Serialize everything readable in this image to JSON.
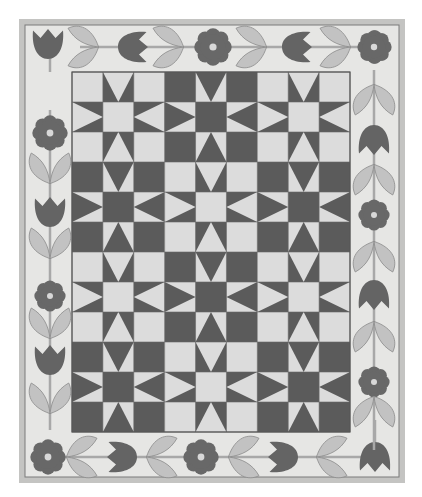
{
  "image": {
    "subject": "Sawtooth star quilt with flower and tulip applique border",
    "mode": "grayscale"
  },
  "colors": {
    "dark": "#5b5b5b",
    "light": "#dcdcdc",
    "border_bg": "#e6e6e4",
    "frame": "#c4c4c2",
    "frame_line": "#7a7a7a",
    "flower": "#686868",
    "tulip": "#646464",
    "leaf": "#c2c2c2",
    "leaf_edge": "#8a8a8a",
    "stem": "#a8a8a8",
    "flower_center": "#d8d8d8"
  },
  "quilt": {
    "block_rows": 4,
    "block_cols": 3,
    "pattern": [
      [
        "light",
        "dark",
        "light"
      ],
      [
        "dark",
        "light",
        "dark"
      ],
      [
        "light",
        "dark",
        "light"
      ],
      [
        "dark",
        "light",
        "dark"
      ]
    ]
  },
  "border": {
    "top": [
      "tulip-up",
      "leaves",
      "tulip-right",
      "leaves",
      "flower",
      "leaves",
      "tulip-right",
      "leaves",
      "flower"
    ],
    "bottom": [
      "flower",
      "leaves",
      "tulip-left",
      "leaves",
      "flower",
      "leaves",
      "tulip-left",
      "leaves",
      "tulip-down"
    ],
    "left": [
      "flower",
      "leaves",
      "tulip",
      "leaves",
      "flower",
      "leaves",
      "tulip",
      "leaves"
    ],
    "right": [
      "flower",
      "leaves",
      "tulip",
      "leaves",
      "flower",
      "leaves",
      "tulip",
      "leaves",
      "flower",
      "leaves",
      "tulip"
    ]
  },
  "caption": ""
}
